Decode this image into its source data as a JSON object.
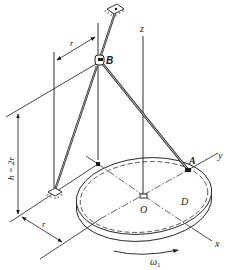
{
  "diagram": {
    "type": "mechanics-figure",
    "labels": {
      "z_axis": "z",
      "y_axis": "y",
      "x_axis": "x",
      "point_B": "B",
      "point_A": "A",
      "origin": "O",
      "disk": "D",
      "radius_top": "r",
      "radius_bottom": "r",
      "height": "h = 2r",
      "omega": "ω",
      "omega_sub": "1"
    },
    "components": [
      "ceiling-support",
      "rod-ceiling-to-B",
      "joint-B",
      "rod-B-to-ground",
      "rod-B-to-A",
      "ground-support",
      "rotating-disk-D",
      "z-axis",
      "x-axis",
      "y-axis",
      "rotation-arrow"
    ],
    "colors": {
      "ink": "#1a1a1a",
      "background": "#ffffff"
    }
  }
}
